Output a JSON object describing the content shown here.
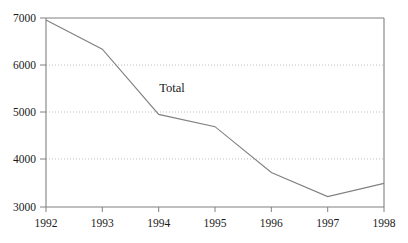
{
  "chart_data": {
    "type": "line",
    "title": "",
    "xlabel": "",
    "ylabel": "",
    "x": [
      1992,
      1993,
      1994,
      1995,
      1996,
      1997,
      1998
    ],
    "xtick_labels": [
      "1992",
      "1993",
      "1994",
      "1995",
      "1996",
      "1997",
      "1998"
    ],
    "ytick_labels": [
      "3000",
      "4000",
      "5000",
      "6000",
      "7000"
    ],
    "ytick_values": [
      3000,
      4000,
      5000,
      6000,
      7000
    ],
    "xlim": [
      1992,
      1998
    ],
    "ylim": [
      3000,
      7000
    ],
    "grid": "horizontal-dotted",
    "legend_position": "inline-annotation",
    "series": [
      {
        "name": "Total",
        "annotation": "Total",
        "color": "#808080",
        "values": [
          6960,
          6340,
          4960,
          4700,
          3730,
          3220,
          3500
        ]
      }
    ]
  },
  "axes": {
    "frame_color": "#808080",
    "gridline_color": "#c8c8c8",
    "background": "#ffffff"
  }
}
